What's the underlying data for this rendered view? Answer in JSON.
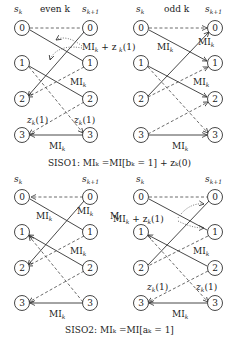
{
  "panels": {
    "siso1_even": {
      "header_left": "s",
      "header_left_sub": "k",
      "header_mid": "even k",
      "header_right": "s",
      "header_right_sub": "k+1"
    },
    "siso1_odd": {
      "header_left": "s",
      "header_left_sub": "k",
      "header_mid": "odd k",
      "header_right": "s",
      "header_right_sub": "k+1"
    },
    "siso2_even": {
      "header_left": "s",
      "header_left_sub": "k",
      "header_right": "s",
      "header_right_sub": "k+1"
    },
    "siso2_odd": {
      "header_left": "s",
      "header_left_sub": "k",
      "header_right": "s",
      "header_right_sub": "k+1"
    }
  },
  "states": [
    "0",
    "1",
    "2",
    "3"
  ],
  "labels": {
    "mi": "MI",
    "mi_sub": "k",
    "mi_plus_z": "MI",
    "mi_plus_z_rest": " + z",
    "z_sub": "k",
    "z_arg": "(1)",
    "z": "z"
  },
  "captions": {
    "siso1": "SISO1:  MIₖ =MI[bₖ = 1] + zₖ(0)",
    "siso2": "SISO2:  MIₖ =MI[aₖ = 1]"
  }
}
